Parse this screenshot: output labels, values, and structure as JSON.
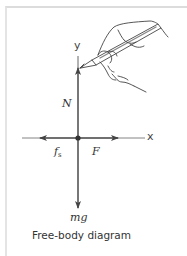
{
  "diagram": {
    "title": "Free-body diagram",
    "axes": {
      "x_label": "x",
      "y_label": "y"
    },
    "forces": [
      {
        "id": "normal",
        "label": "N",
        "direction": "up"
      },
      {
        "id": "static-friction",
        "label": "f",
        "subscript": "s",
        "direction": "left"
      },
      {
        "id": "applied",
        "label": "F",
        "direction": "right"
      },
      {
        "id": "weight",
        "label": "mg",
        "direction": "down"
      }
    ],
    "illustration": "hand-drawing-with-pencil",
    "colors": {
      "line": "#555555",
      "text": "#333333",
      "frame": "#dcdcdc"
    }
  }
}
